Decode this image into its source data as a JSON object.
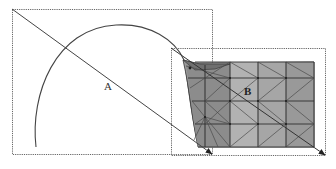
{
  "figure": {
    "labels": {
      "a": "A",
      "b": "B"
    },
    "colors": {
      "line": "#555555",
      "dotted_frame": "#666666",
      "mesh_dark": "#8a8a8a",
      "mesh_mid": "#9c9c9c",
      "mesh_light": "#b4b4b4",
      "mesh_edge": "#3a3a3a",
      "background": "#ffffff"
    },
    "box_a": {
      "x": 12,
      "y": 9,
      "w": 201,
      "h": 146
    },
    "box_b": {
      "x": 171,
      "y": 48,
      "w": 155,
      "h": 108
    },
    "mesh": {
      "columns": 4,
      "rows": 4,
      "x_right": 314,
      "y_top": 62,
      "y_bottom": 147
    }
  }
}
